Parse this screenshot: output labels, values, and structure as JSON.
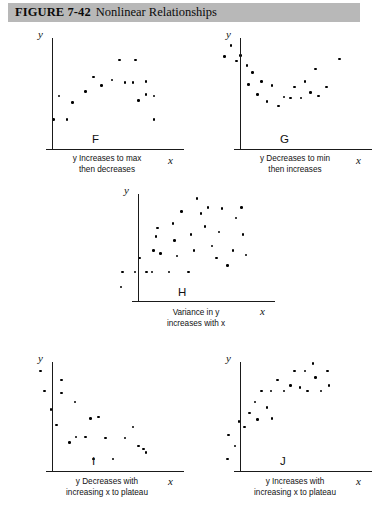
{
  "header": {
    "figure_number": "FIGURE 7-42",
    "title": "Nonlinear Relationships",
    "bar_color": "#b8b8b8"
  },
  "axis_labels": {
    "y": "y",
    "x": "x"
  },
  "chart_data": [
    {
      "type": "scatter",
      "id": "F",
      "letter": "F",
      "caption": "y Increases to max\nthen decreases",
      "xlabel": "x",
      "ylabel": "y",
      "grid": false,
      "xlim": [
        0,
        100
      ],
      "ylim": [
        0,
        100
      ],
      "points": [
        [
          18,
          22
        ],
        [
          28,
          22
        ],
        [
          22,
          43
        ],
        [
          32,
          37
        ],
        [
          42,
          47
        ],
        [
          48,
          60
        ],
        [
          54,
          52
        ],
        [
          62,
          57
        ],
        [
          68,
          75
        ],
        [
          72,
          55
        ],
        [
          78,
          55
        ],
        [
          80,
          75
        ],
        [
          82,
          39
        ],
        [
          88,
          56
        ],
        [
          88,
          44
        ],
        [
          94,
          43
        ],
        [
          94,
          22
        ]
      ]
    },
    {
      "type": "scatter",
      "id": "G",
      "letter": "G",
      "caption": "y Decreases to min\nthen increases",
      "xlabel": "x",
      "ylabel": "y",
      "grid": false,
      "xlim": [
        0,
        100
      ],
      "ylim": [
        0,
        100
      ],
      "points": [
        [
          10,
          88
        ],
        [
          5,
          78
        ],
        [
          14,
          74
        ],
        [
          17,
          79
        ],
        [
          22,
          70
        ],
        [
          26,
          64
        ],
        [
          23,
          53
        ],
        [
          33,
          56
        ],
        [
          30,
          44
        ],
        [
          37,
          38
        ],
        [
          41,
          52
        ],
        [
          46,
          34
        ],
        [
          50,
          42
        ],
        [
          55,
          41
        ],
        [
          58,
          51
        ],
        [
          63,
          41
        ],
        [
          66,
          56
        ],
        [
          70,
          46
        ],
        [
          74,
          67
        ],
        [
          76,
          43
        ],
        [
          82,
          51
        ],
        [
          92,
          76
        ]
      ]
    },
    {
      "type": "scatter",
      "id": "H",
      "letter": "H",
      "caption": "Variance in y\nincreases with x",
      "xlabel": "x",
      "ylabel": "y",
      "grid": false,
      "xlim": [
        0,
        100
      ],
      "ylim": [
        0,
        100
      ],
      "points": [
        [
          8,
          10
        ],
        [
          9,
          24
        ],
        [
          18,
          24
        ],
        [
          21,
          37
        ],
        [
          26,
          24
        ],
        [
          30,
          24
        ],
        [
          31,
          44
        ],
        [
          33,
          57
        ],
        [
          34,
          65
        ],
        [
          36,
          41
        ],
        [
          42,
          24
        ],
        [
          45,
          69
        ],
        [
          46,
          53
        ],
        [
          48,
          39
        ],
        [
          51,
          80
        ],
        [
          56,
          24
        ],
        [
          58,
          59
        ],
        [
          60,
          44
        ],
        [
          62,
          92
        ],
        [
          65,
          78
        ],
        [
          68,
          66
        ],
        [
          70,
          84
        ],
        [
          73,
          48
        ],
        [
          76,
          37
        ],
        [
          78,
          61
        ],
        [
          80,
          83
        ],
        [
          84,
          30
        ],
        [
          88,
          44
        ],
        [
          90,
          74
        ],
        [
          94,
          84
        ],
        [
          95,
          59
        ],
        [
          97,
          40
        ]
      ]
    },
    {
      "type": "scatter",
      "id": "I",
      "letter": "I",
      "caption": "y Decreases with\nincreasing x to plateau",
      "xlabel": "x",
      "ylabel": "y",
      "grid": false,
      "xlim": [
        0,
        100
      ],
      "ylim": [
        0,
        100
      ],
      "points": [
        [
          8,
          90
        ],
        [
          11,
          72
        ],
        [
          16,
          55
        ],
        [
          20,
          41
        ],
        [
          24,
          82
        ],
        [
          24,
          70
        ],
        [
          30,
          25
        ],
        [
          34,
          62
        ],
        [
          35,
          30
        ],
        [
          42,
          30
        ],
        [
          46,
          47
        ],
        [
          48,
          10
        ],
        [
          52,
          48
        ],
        [
          57,
          29
        ],
        [
          63,
          10
        ],
        [
          72,
          29
        ],
        [
          78,
          39
        ],
        [
          82,
          22
        ],
        [
          86,
          19
        ],
        [
          88,
          16
        ]
      ]
    },
    {
      "type": "scatter",
      "id": "J",
      "letter": "J",
      "caption": "y Increases with\nincreasing x to plateau",
      "xlabel": "x",
      "ylabel": "y",
      "grid": false,
      "xlim": [
        0,
        100
      ],
      "ylim": [
        0,
        100
      ],
      "points": [
        [
          7,
          10
        ],
        [
          8,
          32
        ],
        [
          13,
          22
        ],
        [
          16,
          44
        ],
        [
          20,
          39
        ],
        [
          24,
          52
        ],
        [
          28,
          62
        ],
        [
          30,
          46
        ],
        [
          33,
          72
        ],
        [
          37,
          57
        ],
        [
          40,
          72
        ],
        [
          41,
          47
        ],
        [
          45,
          82
        ],
        [
          50,
          72
        ],
        [
          55,
          77
        ],
        [
          58,
          90
        ],
        [
          62,
          75
        ],
        [
          66,
          90
        ],
        [
          68,
          72
        ],
        [
          72,
          97
        ],
        [
          74,
          84
        ],
        [
          78,
          72
        ],
        [
          83,
          90
        ],
        [
          84,
          77
        ]
      ]
    }
  ]
}
